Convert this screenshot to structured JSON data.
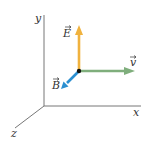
{
  "diagram": {
    "axes": [
      {
        "id": "x",
        "label": "x"
      },
      {
        "id": "y",
        "label": "y"
      },
      {
        "id": "z",
        "label": "z"
      }
    ],
    "vectors": [
      {
        "id": "E",
        "label": "E",
        "direction": "+y",
        "color": "#f0b23e"
      },
      {
        "id": "v",
        "label": "v",
        "direction": "+x",
        "color": "#7fae7c"
      },
      {
        "id": "B",
        "label": "B",
        "direction": "+z",
        "color": "#2b8fd0"
      }
    ],
    "axis_color": "#777777",
    "origin_point_color": "#111111"
  }
}
